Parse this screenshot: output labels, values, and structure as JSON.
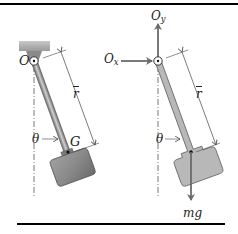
{
  "figure": {
    "colors": {
      "rule": "#000000",
      "rod_fill": "#9a9a9a",
      "rod_dark": "#5a5a5a",
      "bob_fill": "#8f8f8f",
      "fbd_fill": "#b8b8b8",
      "arrow": "#6a6a6a",
      "support": "#a8a8a8",
      "centerline": "#555555",
      "label": "#222222"
    }
  },
  "left_panel": {
    "name": "pendulum",
    "pivot_label": "O",
    "distance_label": "r",
    "angle_label": "θ",
    "center_of_mass_label": "G"
  },
  "right_panel": {
    "name": "free-body-diagram",
    "horizontal_reaction": {
      "symbol": "O",
      "subscript": "x"
    },
    "vertical_reaction": {
      "symbol": "O",
      "subscript": "y"
    },
    "distance_label": "r",
    "angle_label": "θ",
    "weight_label": "mg"
  }
}
